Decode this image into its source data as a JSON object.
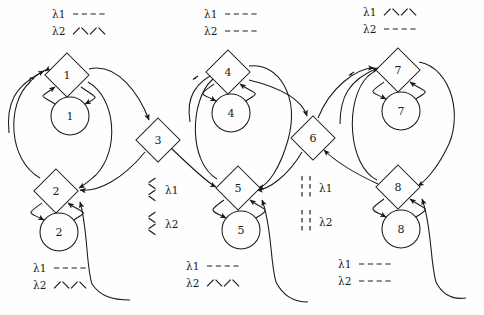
{
  "diagram": {
    "type": "petri-net",
    "background_color": "#fefefe",
    "line_color": "#1a1a1a",
    "width": 484,
    "height": 315
  },
  "nodes": [
    {
      "id": "d1",
      "label": "1",
      "shape": "diamond",
      "cx": 67,
      "cy": 75,
      "r": 22
    },
    {
      "id": "c1",
      "label": "1",
      "shape": "circle",
      "cx": 70,
      "cy": 116,
      "r": 19
    },
    {
      "id": "d2",
      "label": "2",
      "shape": "diamond",
      "cx": 56,
      "cy": 191,
      "r": 22
    },
    {
      "id": "c2",
      "label": "2",
      "shape": "circle",
      "cx": 59,
      "cy": 232,
      "r": 19
    },
    {
      "id": "d3",
      "label": "3",
      "shape": "diamond",
      "cx": 158,
      "cy": 140,
      "r": 22
    },
    {
      "id": "d4",
      "label": "4",
      "shape": "diamond",
      "cx": 228,
      "cy": 72,
      "r": 22
    },
    {
      "id": "c4",
      "label": "4",
      "shape": "circle",
      "cx": 231,
      "cy": 113,
      "r": 19
    },
    {
      "id": "d5",
      "label": "5",
      "shape": "diamond",
      "cx": 238,
      "cy": 188,
      "r": 22
    },
    {
      "id": "c5",
      "label": "5",
      "shape": "circle",
      "cx": 241,
      "cy": 230,
      "r": 19
    },
    {
      "id": "d6",
      "label": "6",
      "shape": "diamond",
      "cx": 313,
      "cy": 138,
      "r": 22
    },
    {
      "id": "d7",
      "label": "7",
      "shape": "diamond",
      "cx": 398,
      "cy": 70,
      "r": 22
    },
    {
      "id": "c7",
      "label": "7",
      "shape": "circle",
      "cx": 401,
      "cy": 111,
      "r": 19
    },
    {
      "id": "d8",
      "label": "8",
      "shape": "diamond",
      "cx": 398,
      "cy": 187,
      "r": 22
    },
    {
      "id": "c8",
      "label": "8",
      "shape": "circle",
      "cx": 401,
      "cy": 229,
      "r": 19
    }
  ],
  "legends": [
    {
      "id": "legend-top-left",
      "x": 52,
      "y": 14,
      "orientation": "horizontal",
      "entries": [
        {
          "label": "λ1",
          "pattern": "dashed"
        },
        {
          "label": "λ2",
          "pattern": "zigzag"
        }
      ]
    },
    {
      "id": "legend-top-middle",
      "x": 204,
      "y": 14,
      "orientation": "horizontal",
      "entries": [
        {
          "label": "λ1",
          "pattern": "dashed"
        },
        {
          "label": "λ2",
          "pattern": "dashed"
        }
      ]
    },
    {
      "id": "legend-top-right",
      "x": 363,
      "y": 12,
      "orientation": "horizontal",
      "entries": [
        {
          "label": "λ1",
          "pattern": "zigzag"
        },
        {
          "label": "λ2",
          "pattern": "dashed"
        }
      ]
    },
    {
      "id": "legend-center-left",
      "x": 152,
      "y": 178,
      "orientation": "vertical",
      "entries": [
        {
          "label": "λ1",
          "pattern": "zigzag"
        },
        {
          "label": "λ2",
          "pattern": "zigzag"
        }
      ]
    },
    {
      "id": "legend-center-right",
      "x": 306,
      "y": 176,
      "orientation": "vertical",
      "entries": [
        {
          "label": "λ1",
          "pattern": "dashed"
        },
        {
          "label": "λ2",
          "pattern": "dashed"
        }
      ]
    },
    {
      "id": "legend-bottom-left",
      "x": 33,
      "y": 268,
      "orientation": "horizontal",
      "entries": [
        {
          "label": "λ1",
          "pattern": "dashed"
        },
        {
          "label": "λ2",
          "pattern": "zigzag"
        }
      ]
    },
    {
      "id": "legend-bottom-middle",
      "x": 186,
      "y": 266,
      "orientation": "horizontal",
      "entries": [
        {
          "label": "λ1",
          "pattern": "dashed"
        },
        {
          "label": "λ2",
          "pattern": "zigzag"
        }
      ]
    },
    {
      "id": "legend-bottom-right",
      "x": 338,
      "y": 264,
      "orientation": "horizontal",
      "entries": [
        {
          "label": "λ1",
          "pattern": "dashed"
        },
        {
          "label": "λ2",
          "pattern": "dashed"
        }
      ]
    }
  ],
  "edges": [
    {
      "id": "e-d1-c1",
      "from": "d1",
      "to": "c1",
      "style": "arc-right"
    },
    {
      "id": "e-c1-d1",
      "from": "c1",
      "to": "d1",
      "style": "arc-left"
    },
    {
      "id": "e-d2-c2",
      "from": "d2",
      "to": "c2",
      "style": "arc-left"
    },
    {
      "id": "e-c2-d2",
      "from": "c2",
      "to": "d2",
      "style": "arc-right"
    },
    {
      "id": "e-d4-c4",
      "from": "d4",
      "to": "c4",
      "style": "arc-left"
    },
    {
      "id": "e-c4-d4",
      "from": "c4",
      "to": "d4",
      "style": "arc-right"
    },
    {
      "id": "e-d5-c5",
      "from": "d5",
      "to": "c5",
      "style": "arc-left"
    },
    {
      "id": "e-c5-d5",
      "from": "c5",
      "to": "d5",
      "style": "arc-right"
    },
    {
      "id": "e-d7-c7",
      "from": "d7",
      "to": "c7",
      "style": "arc-left"
    },
    {
      "id": "e-c7-d7",
      "from": "c7",
      "to": "d7",
      "style": "arc-right"
    },
    {
      "id": "e-d8-c8",
      "from": "d8",
      "to": "c8",
      "style": "arc-left"
    },
    {
      "id": "e-c8-d8",
      "from": "c8",
      "to": "d8",
      "style": "arc-right"
    },
    {
      "id": "e-d1-d3",
      "from": "d1",
      "to": "d3",
      "style": "long-curve"
    },
    {
      "id": "e-d3-d2",
      "from": "d3",
      "to": "d2",
      "style": "long-curve"
    },
    {
      "id": "e-d2-d1",
      "from": "d2",
      "to": "d1",
      "style": "long-curve-outer"
    },
    {
      "id": "e-d4-d6",
      "from": "d4",
      "to": "d6",
      "style": "long-curve"
    },
    {
      "id": "e-d3-d5",
      "from": "d3",
      "to": "d5",
      "style": "long-curve"
    },
    {
      "id": "e-d5-d4",
      "from": "d5",
      "to": "d4",
      "style": "long-curve-outer"
    },
    {
      "id": "e-d6-d5",
      "from": "d6",
      "to": "d5",
      "style": "long-curve"
    },
    {
      "id": "e-d7-d8",
      "from": "d7",
      "to": "d8",
      "style": "long-curve"
    },
    {
      "id": "e-d8-d7",
      "from": "d8",
      "to": "d7",
      "style": "long-curve-outer"
    },
    {
      "id": "e-d6-d7",
      "from": "d6",
      "to": "d7",
      "style": "long-curve"
    },
    {
      "id": "e-d8-d6",
      "from": "d8",
      "to": "d6",
      "style": "long-curve"
    },
    {
      "id": "e-bottom-c2",
      "from": "c2",
      "to": "d2",
      "style": "bottom-feedback"
    },
    {
      "id": "e-bottom-c5",
      "from": "c5",
      "to": "d5",
      "style": "bottom-feedback"
    },
    {
      "id": "e-bottom-c8",
      "from": "c8",
      "to": "d8",
      "style": "bottom-feedback"
    }
  ]
}
